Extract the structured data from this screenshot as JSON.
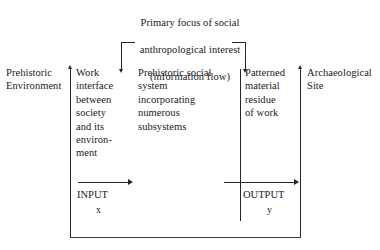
{
  "figure": {
    "caption": {
      "line1": "Primary focus of social",
      "line2": "anthropological interest",
      "line3": "(information flow)"
    },
    "columns": {
      "prehistoric_environment": "Prehistoric\nEnvironment",
      "work_interface": "Work\ninterface\nbetween\nsociety\nand its\nenviron-\nment",
      "social_system": "Prehistoric social\nsystem\nincorporating\nnumerous\nsubsystems",
      "material_residue": "Patterned\nmaterial\nresidue\nof work",
      "archaeological_site": "Archaeological\nSite"
    },
    "flow": {
      "input_label": "INPUT",
      "input_variable": "x",
      "output_label": "OUTPUT",
      "output_variable": "y"
    },
    "colors": {
      "ink": "#1a1a1a",
      "rule": "#262626",
      "box": "#3a3a3a",
      "background": "#ffffff"
    },
    "icons": {
      "up_arrow_left": "arrow-up-icon",
      "up_arrow_right": "arrow-up-icon",
      "down_arrow_left": "arrow-down-icon",
      "down_arrow_right": "arrow-down-icon",
      "input_arrow": "arrow-right-icon",
      "output_arrow": "arrow-right-icon"
    }
  },
  "chart_data": {
    "type": "diagram",
    "title": "Primary focus of social anthropological interest (information flow)",
    "nodes": [
      {
        "id": "prehistoric_environment",
        "label": "Prehistoric Environment",
        "order": 1
      },
      {
        "id": "work_interface",
        "label": "Work interface between society and its environment",
        "order": 2
      },
      {
        "id": "social_system",
        "label": "Prehistoric social system incorporating numerous subsystems",
        "order": 3
      },
      {
        "id": "material_residue",
        "label": "Patterned material residue of work",
        "order": 4
      },
      {
        "id": "archaeological_site",
        "label": "Archaeological Site",
        "order": 5
      }
    ],
    "edges": [
      {
        "from": "prehistoric_environment",
        "to": "work_interface",
        "label": "INPUT x"
      },
      {
        "from": "material_residue",
        "to": "archaeological_site",
        "label": "OUTPUT y"
      },
      {
        "from": "information_flow_bracket",
        "to": "work_interface",
        "label": ""
      },
      {
        "from": "information_flow_bracket",
        "to": "material_residue",
        "label": ""
      }
    ],
    "annotations": [
      "Primary focus of social anthropological interest",
      "(information flow)",
      "INPUT x",
      "OUTPUT y"
    ]
  }
}
